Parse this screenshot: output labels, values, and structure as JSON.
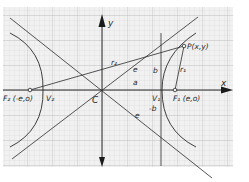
{
  "diagram": {
    "type": "hyperbola-on-graph-paper",
    "colors": {
      "paper": "#f1f1f1",
      "grid_minor": "#d2d2d2",
      "grid_major": "#b4b4b4",
      "ink": "#2a2a2a"
    },
    "axes": {
      "x_label": "x",
      "y_label": "y"
    },
    "labels": {
      "center": "C",
      "focus_right": "F₁ (e,o)",
      "focus_left": "F₂ (-e,o)",
      "vertex_right": "V₁",
      "vertex_left": "V₂",
      "point": "P(x,y)",
      "r1": "r₁",
      "r2": "r₂",
      "e_upper": "e",
      "e_lower": "e",
      "a": "a",
      "b_upper": "b",
      "b_lower": "-b"
    }
  }
}
